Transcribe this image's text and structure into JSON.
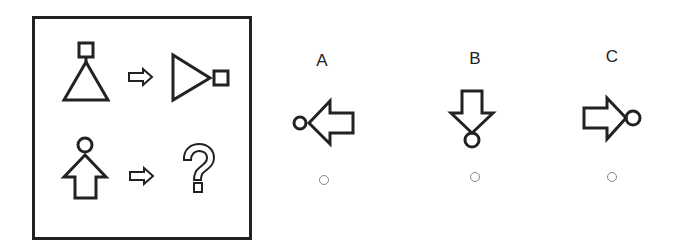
{
  "puzzle": {
    "rows": [
      {
        "source": "square-on-triangle-up",
        "transition": "arrow-right",
        "result": "triangle-right-with-square"
      },
      {
        "source": "circle-on-up-arrow",
        "transition": "arrow-right",
        "result": "question-mark"
      }
    ]
  },
  "options": [
    {
      "label": "A",
      "figure": "circle-left-of-left-arrow",
      "selected": false
    },
    {
      "label": "B",
      "figure": "down-arrow-with-circle-below",
      "selected": false
    },
    {
      "label": "C",
      "figure": "right-arrow-with-circle-right",
      "selected": false
    }
  ],
  "colors": {
    "stroke": "#222222",
    "radio_border": "#888888",
    "background": "#ffffff"
  }
}
